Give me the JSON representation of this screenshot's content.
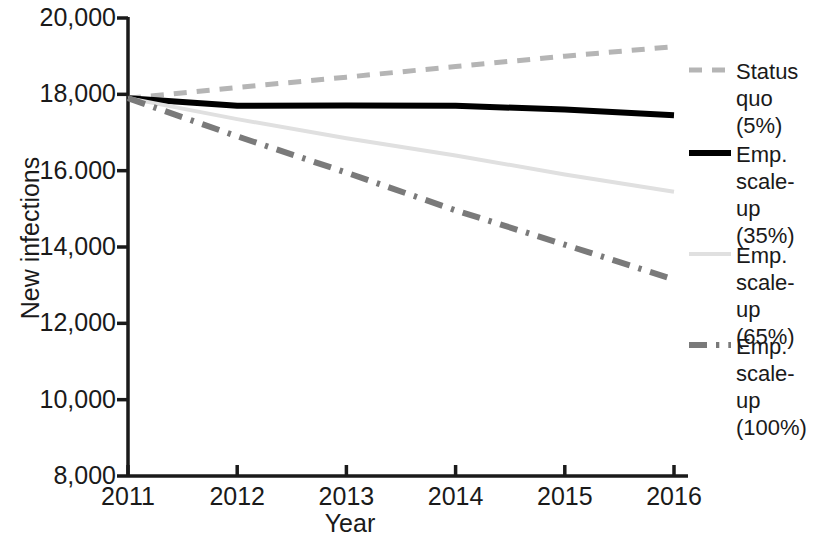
{
  "chart_data": {
    "type": "line",
    "title": "",
    "subtitle": "",
    "xlabel": "Year",
    "ylabel": "New infections",
    "x": [
      2011,
      2012,
      2013,
      2014,
      2015,
      2016
    ],
    "categories": [
      "2011",
      "2012",
      "2013",
      "2014",
      "2015",
      "2016"
    ],
    "xlim": [
      2011,
      2016
    ],
    "ylim": [
      8000,
      20000
    ],
    "ytick_values": [
      8000,
      10000,
      12000,
      14000,
      16000,
      18000,
      20000
    ],
    "ytick_labels": [
      "8,000",
      "10,000",
      "12,000",
      "14,000",
      "16.000",
      "18,000",
      "20,000"
    ],
    "xtick_labels": [
      "2011",
      "2012",
      "2013",
      "2014",
      "2015",
      "2016"
    ],
    "grid": false,
    "legend_position": "right",
    "series": [
      {
        "name": "Status quo (5%)",
        "label": "Status\nquo (5%)",
        "values": [
          17900,
          18180,
          18450,
          18730,
          19000,
          19250
        ],
        "color": "#b5b5b5",
        "style": "dashed",
        "width": 5
      },
      {
        "name": "Emp. scale-up (35%)",
        "label": "Emp.\nscale-up\n(35%)",
        "values": [
          17900,
          17700,
          17710,
          17700,
          17600,
          17450
        ],
        "color": "#000000",
        "style": "solid",
        "width": 6
      },
      {
        "name": "Emp. scale-up (65%)",
        "label": "Emp.\nscale-up\n(65%)",
        "values": [
          17900,
          17350,
          16850,
          16400,
          15900,
          15450
        ],
        "color": "#e0e0e0",
        "style": "solid",
        "width": 4
      },
      {
        "name": "Emp. scale-up (100%)",
        "label": "Emp.\nscale-up\n(100%)",
        "values": [
          17900,
          16900,
          15950,
          14960,
          14060,
          13150
        ],
        "color": "#7a7a7a",
        "style": "dashdot",
        "width": 6
      }
    ]
  },
  "axes": {
    "axis_color": "#1a1a1a"
  }
}
